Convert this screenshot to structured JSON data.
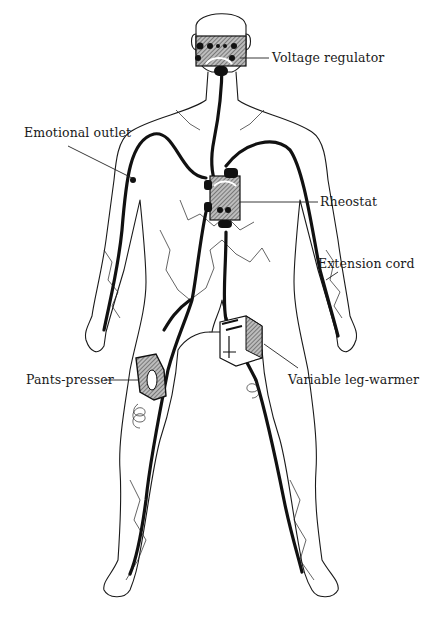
{
  "figure": {
    "labels": [
      {
        "id": "voltage-regulator",
        "text": "Voltage regulator"
      },
      {
        "id": "emotional-outlet",
        "text": "Emotional outlet"
      },
      {
        "id": "rheostat",
        "text": "Rheostat"
      },
      {
        "id": "extension-cord",
        "text": "Extension cord"
      },
      {
        "id": "pants-presser",
        "text": "Pants-presser"
      },
      {
        "id": "variable-leg-warmer",
        "text": "Variable leg-warmer"
      }
    ]
  }
}
